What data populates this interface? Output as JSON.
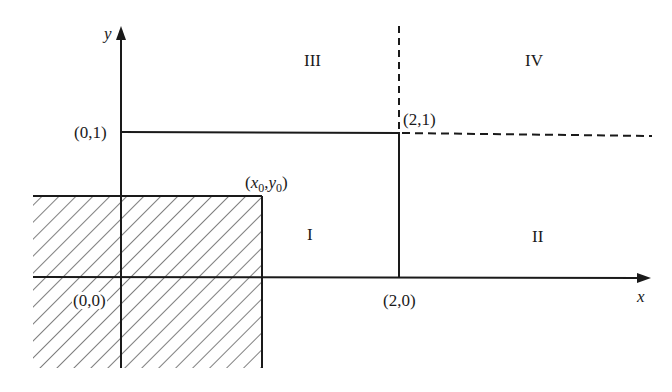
{
  "diagram": {
    "axes": {
      "x_label": "x",
      "y_label": "y"
    },
    "points": {
      "origin": "(0,0)",
      "p01": "(0,1)",
      "p20": "(2,0)",
      "p21": "(2,1)",
      "x0y0": {
        "open": "(",
        "x": "x",
        "x_sub": "0",
        "comma": ",",
        "y": "y",
        "y_sub": "0",
        "close": ")"
      }
    },
    "regions": {
      "r1": "I",
      "r2": "II",
      "r3": "III",
      "r4": "IV"
    },
    "styles": {
      "line_color": "#1a1a1a",
      "hatch_color": "#2a2a2a",
      "background": "#ffffff"
    }
  }
}
